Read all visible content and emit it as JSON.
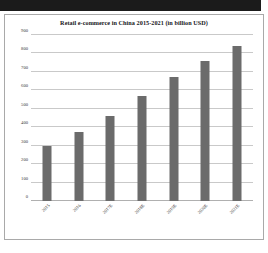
{
  "chart_data": {
    "type": "bar",
    "title": "Retail e-commerce in China 2015-2021 (in billion USD)",
    "categories": [
      "2015",
      "2016",
      "2017E",
      "2018E",
      "2019E",
      "2020E",
      "2021E"
    ],
    "values": [
      300,
      375,
      460,
      570,
      670,
      760,
      840
    ],
    "xlabel": "",
    "ylabel": "",
    "ylim": [
      0,
      900
    ],
    "ytick_labels": [
      "0",
      "100",
      "200",
      "300",
      "400",
      "500",
      "600",
      "700",
      "800",
      "900"
    ],
    "ytick_values": [
      0,
      100,
      200,
      300,
      400,
      500,
      600,
      700,
      800,
      900
    ],
    "grid": true,
    "legend": false,
    "bar_color": "#6b6b6b",
    "gridline_color": "#c9c9c9",
    "background_color": "#ffffff",
    "border_color": "#a9a9a9"
  },
  "page": {
    "top_band_color": "#1b1b1b"
  }
}
